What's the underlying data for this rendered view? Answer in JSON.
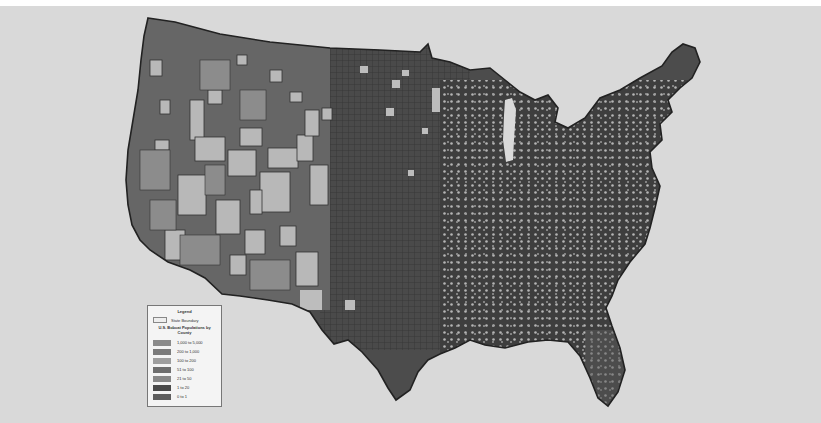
{
  "title": {
    "text": "U.S. Bobcat Populations by County",
    "visible": "cropped"
  },
  "map": {
    "type": "choropleth",
    "region": "Contiguous United States",
    "unit": "County",
    "color_scheme": "grayscale",
    "background": "#d9d9d9",
    "outline_color": "#2a2a2a",
    "highest_density_region": "Great Plains / Midwest",
    "lowest_density_region": "Western interior (Nevada, Utah, Arizona)"
  },
  "legend": {
    "title": "Legend",
    "boundary_label": "State Boundary",
    "subtitle": "U.S. Bobcat Populations by County",
    "classes": [
      {
        "label": "1,000 to 5,000",
        "color": "#8a8a8a"
      },
      {
        "label": "200 to 1,000",
        "color": "#7a7a7a"
      },
      {
        "label": "100 to 200",
        "color": "#9e9e9e"
      },
      {
        "label": "51 to 100",
        "color": "#6e6e6e"
      },
      {
        "label": "21 to 50",
        "color": "#888888"
      },
      {
        "label": "1 to 20",
        "color": "#4a4a4a"
      },
      {
        "label": "0 to 1",
        "color": "#5e5e5e"
      }
    ]
  }
}
